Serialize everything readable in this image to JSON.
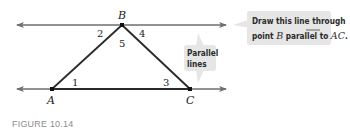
{
  "figure": {
    "caption": "FIGURE 10.14",
    "points": {
      "A": {
        "label": "A",
        "x": 52,
        "y": 89
      },
      "B": {
        "label": "B",
        "x": 122,
        "y": 25
      },
      "C": {
        "label": "C",
        "x": 190,
        "y": 89
      }
    },
    "angles": {
      "a1": "1",
      "a2": "2",
      "a3": "3",
      "a4": "4",
      "a5": "5"
    },
    "callouts": {
      "draw_line": {
        "line1": "Draw this line through",
        "line2_prefix": "point ",
        "line2_point": "B",
        "line2_middle": " parallel to ",
        "line2_segment": "AC",
        "line2_suffix": "."
      },
      "parallel": {
        "line1": "Parallel",
        "line2": "lines"
      }
    },
    "colors": {
      "line": "#6e6e6e",
      "triangle": "#2a2a2a",
      "callout_bg": "#e6e6e6",
      "caption": "#8c8c8c"
    }
  }
}
